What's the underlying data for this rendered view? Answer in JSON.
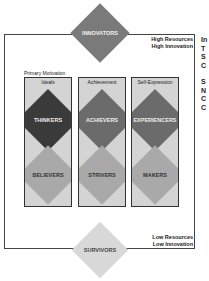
{
  "diagram": {
    "top_segment": {
      "label": "INNOVATORS",
      "annotation": [
        "High Resources",
        "High Innovation"
      ],
      "color": "#7a7a7a"
    },
    "bottom_segment": {
      "label": "SURVIVORS",
      "annotation": [
        "Low Resources",
        "Low Innovation"
      ],
      "color": "#d8d8d8"
    },
    "primary_motivation_label": "Primary Motivation",
    "columns": [
      {
        "header": "Ideals",
        "high": "THINKERS",
        "high_color": "#3a3a3a",
        "low": "BELIEVERS",
        "low_color": "#a9a9a9"
      },
      {
        "header": "Achievement",
        "high": "ACHIEVERS",
        "high_color": "#6b6b6b",
        "low": "STRIVERS",
        "low_color": "#a9a9a9"
      },
      {
        "header": "Self-Expression",
        "high": "EXPERIENCERS",
        "high_color": "#6b6b6b",
        "low": "MAKERS",
        "low_color": "#a9a9a9"
      }
    ],
    "box_fill": "#d4d4d4",
    "right_edge_fragment": [
      "In",
      "T",
      "S",
      "C",
      "",
      "S",
      "N",
      "C",
      "C"
    ]
  }
}
